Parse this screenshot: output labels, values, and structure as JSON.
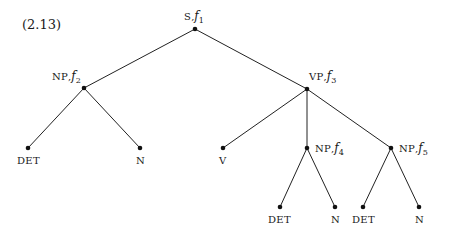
{
  "example_number": "(2.13)",
  "tree": {
    "nodes": [
      {
        "id": "s",
        "cat": "S",
        "f": "f",
        "sub": "1"
      },
      {
        "id": "np2",
        "cat": "NP",
        "f": "f",
        "sub": "2"
      },
      {
        "id": "vp3",
        "cat": "VP",
        "f": "f",
        "sub": "3"
      },
      {
        "id": "det1",
        "cat": "DET"
      },
      {
        "id": "n1",
        "cat": "N"
      },
      {
        "id": "v",
        "cat": "V"
      },
      {
        "id": "np4",
        "cat": "NP",
        "f": "f",
        "sub": "4"
      },
      {
        "id": "np5",
        "cat": "NP",
        "f": "f",
        "sub": "5"
      },
      {
        "id": "det4",
        "cat": "DET"
      },
      {
        "id": "n4",
        "cat": "N"
      },
      {
        "id": "det5",
        "cat": "DET"
      },
      {
        "id": "n5",
        "cat": "N"
      }
    ],
    "edges": [
      [
        "s",
        "np2"
      ],
      [
        "s",
        "vp3"
      ],
      [
        "np2",
        "det1"
      ],
      [
        "np2",
        "n1"
      ],
      [
        "vp3",
        "v"
      ],
      [
        "vp3",
        "np4"
      ],
      [
        "vp3",
        "np5"
      ],
      [
        "np4",
        "det4"
      ],
      [
        "np4",
        "n4"
      ],
      [
        "np5",
        "det5"
      ],
      [
        "np5",
        "n5"
      ]
    ]
  }
}
